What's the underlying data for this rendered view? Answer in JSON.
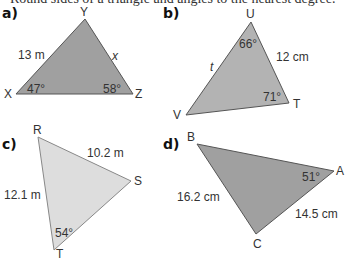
{
  "header": {
    "fragment": "Round sides of a triangle and angles to the nearest degree."
  },
  "colors": {
    "dark_fill": "#9e9e9e",
    "mid_fill": "#b3b3b3",
    "light_fill": "#dcdcdc",
    "stroke": "#555555",
    "text": "#333333"
  },
  "triangles": [
    {
      "part": "a)",
      "fill": "dark",
      "vertices": {
        "Y": [
          85,
          19
        ],
        "X": [
          16,
          94
        ],
        "Z": [
          133,
          94
        ]
      },
      "vertex_labels": {
        "Y": "Y",
        "X": "X",
        "Z": "Z"
      },
      "side_labels": {
        "XY": "13 m",
        "YZ": "x"
      },
      "angle_labels": {
        "X": "47°",
        "Z": "58°"
      }
    },
    {
      "part": "b)",
      "fill": "mid",
      "vertices": {
        "U": [
          251,
          22
        ],
        "V": [
          186,
          115
        ],
        "T": [
          289,
          103
        ]
      },
      "vertex_labels": {
        "U": "U",
        "V": "V",
        "T": "T"
      },
      "side_labels": {
        "UV": "t",
        "UT": "12 cm"
      },
      "angle_labels": {
        "U": "66°",
        "T": "71°"
      }
    },
    {
      "part": "c)",
      "fill": "light",
      "vertices": {
        "R": [
          38,
          137
        ],
        "S": [
          131,
          181
        ],
        "T": [
          54,
          250
        ]
      },
      "vertex_labels": {
        "R": "R",
        "S": "S",
        "T": "T"
      },
      "side_labels": {
        "RS": "10.2 m",
        "RT": "12.1 m"
      },
      "angle_labels": {
        "T": "54°"
      }
    },
    {
      "part": "d)",
      "fill": "dark",
      "vertices": {
        "B": [
          197,
          144
        ],
        "A": [
          334,
          171
        ],
        "C": [
          256,
          234
        ]
      },
      "vertex_labels": {
        "B": "B",
        "A": "A",
        "C": "C"
      },
      "side_labels": {
        "BC": "16.2 cm",
        "AC": "14.5 cm"
      },
      "angle_labels": {
        "A": "51°"
      }
    }
  ]
}
